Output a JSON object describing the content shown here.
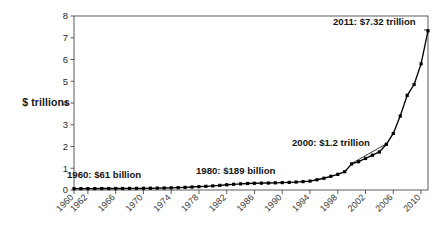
{
  "chart_data": {
    "type": "line",
    "title": "",
    "xlabel": "",
    "ylabel": "$ trillions",
    "ylim": [
      0,
      8
    ],
    "xlim": [
      1960,
      2011
    ],
    "ytick_labels": [
      "0",
      "1",
      "2",
      "3",
      "4",
      "5",
      "6",
      "7",
      "8"
    ],
    "ytick_values": [
      0,
      1,
      2,
      3,
      4,
      5,
      6,
      7,
      8
    ],
    "xtick_labels": [
      "1960",
      "1962",
      "1966",
      "1970",
      "1974",
      "1978",
      "1982",
      "1986",
      "1990",
      "1994",
      "1998",
      "2002",
      "2006",
      "2010"
    ],
    "xtick_values": [
      1960,
      1962,
      1966,
      1970,
      1974,
      1978,
      1982,
      1986,
      1990,
      1994,
      1998,
      2002,
      2006,
      2010
    ],
    "grid": false,
    "legend": false,
    "marker": "square",
    "line_color": "#000000",
    "marker_color": "#000000",
    "x": [
      1960,
      1961,
      1962,
      1963,
      1964,
      1965,
      1966,
      1967,
      1968,
      1969,
      1970,
      1971,
      1972,
      1973,
      1974,
      1975,
      1976,
      1977,
      1978,
      1979,
      1980,
      1981,
      1982,
      1983,
      1984,
      1985,
      1986,
      1987,
      1988,
      1989,
      1990,
      1991,
      1992,
      1993,
      1994,
      1995,
      1996,
      1997,
      1998,
      1999,
      2000,
      2001,
      2002,
      2003,
      2004,
      2005,
      2006,
      2007,
      2008,
      2009,
      2010,
      2011
    ],
    "values": [
      0.061,
      0.062,
      0.063,
      0.065,
      0.067,
      0.068,
      0.07,
      0.071,
      0.073,
      0.075,
      0.078,
      0.082,
      0.087,
      0.093,
      0.1,
      0.11,
      0.122,
      0.136,
      0.153,
      0.17,
      0.189,
      0.213,
      0.24,
      0.262,
      0.284,
      0.3,
      0.31,
      0.315,
      0.32,
      0.33,
      0.34,
      0.35,
      0.365,
      0.385,
      0.41,
      0.47,
      0.54,
      0.63,
      0.72,
      0.84,
      1.2,
      1.3,
      1.45,
      1.6,
      1.75,
      2.1,
      2.6,
      3.4,
      4.35,
      4.85,
      5.8,
      7.32
    ],
    "series": [
      {
        "name": "Total",
        "values": [
          0.061,
          0.062,
          0.063,
          0.065,
          0.067,
          0.068,
          0.07,
          0.071,
          0.073,
          0.075,
          0.078,
          0.082,
          0.087,
          0.093,
          0.1,
          0.11,
          0.122,
          0.136,
          0.153,
          0.17,
          0.189,
          0.213,
          0.24,
          0.262,
          0.284,
          0.3,
          0.31,
          0.315,
          0.32,
          0.33,
          0.34,
          0.35,
          0.365,
          0.385,
          0.41,
          0.47,
          0.54,
          0.63,
          0.72,
          0.84,
          1.2,
          1.3,
          1.45,
          1.6,
          1.75,
          2.1,
          2.6,
          3.4,
          4.35,
          4.85,
          5.8,
          7.32
        ]
      }
    ],
    "annotations": [
      {
        "id": "a1960",
        "text": "1960: $61 billion",
        "x": 1960,
        "y": 0.061
      },
      {
        "id": "a1980",
        "text": "1980: $189 billion",
        "x": 1980,
        "y": 0.189
      },
      {
        "id": "a2000",
        "text": "2000: $1.2 trillion",
        "x": 2000,
        "y": 1.2
      },
      {
        "id": "a2011",
        "text": "2011: $7.32 trillion",
        "x": 2011,
        "y": 7.32
      }
    ]
  },
  "chart": {
    "y_axis_title": "$ trillions",
    "annotation_1960": "1960: $61 billion",
    "annotation_1980": "1980: $189 billion",
    "annotation_2000": "2000: $1.2 trillion",
    "annotation_2011": "2011: $7.32 trillion"
  }
}
